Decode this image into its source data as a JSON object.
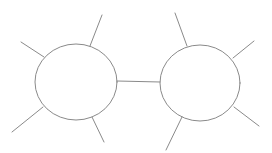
{
  "diagram": {
    "background": "#ffffff",
    "stroke_color": "#8a8a8a",
    "nodes": [
      {
        "id": "left-node",
        "shape": "ellipse",
        "cx": 76,
        "cy": 82,
        "rx": 41,
        "ry": 38,
        "spokes": [
          {
            "x1": 90,
            "y1": 46,
            "x2": 102,
            "y2": 15
          },
          {
            "x1": 44,
            "y1": 57,
            "x2": 21,
            "y2": 42
          },
          {
            "x1": 43,
            "y1": 107,
            "x2": 12,
            "y2": 132
          },
          {
            "x1": 92,
            "y1": 117,
            "x2": 104,
            "y2": 142
          }
        ]
      },
      {
        "id": "right-node",
        "shape": "ellipse",
        "cx": 200,
        "cy": 83,
        "rx": 40,
        "ry": 38,
        "spokes": [
          {
            "x1": 187,
            "y1": 46,
            "x2": 175,
            "y2": 13
          },
          {
            "x1": 233,
            "y1": 58,
            "x2": 254,
            "y2": 41
          },
          {
            "x1": 234,
            "y1": 107,
            "x2": 259,
            "y2": 126
          },
          {
            "x1": 182,
            "y1": 117,
            "x2": 166,
            "y2": 150
          }
        ]
      }
    ],
    "edges": [
      {
        "from": "left-node",
        "to": "right-node",
        "x1": 117,
        "y1": 81,
        "x2": 160,
        "y2": 82
      }
    ]
  }
}
